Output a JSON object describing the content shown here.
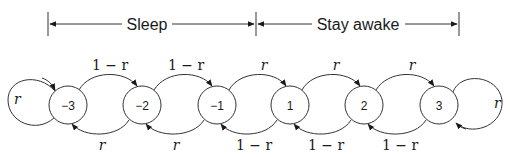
{
  "brackets": [
    {
      "label": "Sleep",
      "x1": 48,
      "x2": 256
    },
    {
      "label": "Stay awake",
      "x1": 256,
      "x2": 459
    }
  ],
  "nodes": [
    {
      "label": "−3",
      "cx": 68
    },
    {
      "label": "−2",
      "cx": 142
    },
    {
      "label": "−1",
      "cx": 217
    },
    {
      "label": "1",
      "cx": 290
    },
    {
      "label": "2",
      "cx": 364
    },
    {
      "label": "3",
      "cx": 439
    }
  ],
  "top_edges": [
    {
      "from": "-3",
      "to": "-2",
      "label": "1 − r"
    },
    {
      "from": "-2",
      "to": "-1",
      "label": "1 − r"
    },
    {
      "from": "-1",
      "to": "1",
      "label": "r"
    },
    {
      "from": "1",
      "to": "2",
      "label": "r"
    },
    {
      "from": "2",
      "to": "3",
      "label": "r"
    }
  ],
  "bottom_edges": [
    {
      "from": "-2",
      "to": "-3",
      "label": "r"
    },
    {
      "from": "-1",
      "to": "-2",
      "label": "r"
    },
    {
      "from": "1",
      "to": "-1",
      "label": "1 − r"
    },
    {
      "from": "2",
      "to": "1",
      "label": "1 − r"
    },
    {
      "from": "3",
      "to": "2",
      "label": "1 − r"
    }
  ],
  "self_loops": [
    {
      "node": "-3",
      "label": "r",
      "side": "left"
    },
    {
      "node": "3",
      "label": "r",
      "side": "right"
    }
  ],
  "labels": {
    "sleep": "Sleep",
    "stay_awake": "Stay awake",
    "n_m3": "−3",
    "n_m2": "−2",
    "n_m1": "−1",
    "n_1": "1",
    "n_2": "2",
    "n_3": "3",
    "top_m3_m2": "1 − r",
    "top_m2_m1": "1 − r",
    "top_m1_1": "r",
    "top_1_2": "r",
    "top_2_3": "r",
    "bot_m2_m3": "r",
    "bot_m1_m2": "r",
    "bot_1_m1": "1 − r",
    "bot_2_1": "1 − r",
    "bot_3_2": "1 − r",
    "loop_m3": "r",
    "loop_3": "r"
  }
}
